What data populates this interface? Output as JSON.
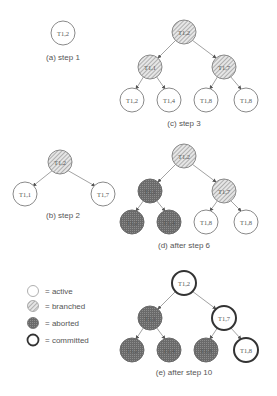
{
  "colors": {
    "stroke": "#8a8a8a",
    "text": "#555555",
    "branched_fill": "#cfcfcf",
    "aborted_fill": "#6e6e6e",
    "committed_stroke": "#333333"
  },
  "legend": {
    "items": [
      {
        "state": "active",
        "label": "= active"
      },
      {
        "state": "branched",
        "label": "= branched"
      },
      {
        "state": "aborted",
        "label": "= aborted"
      },
      {
        "state": "committed",
        "label": "= committed"
      }
    ]
  },
  "panels": {
    "a": {
      "caption": "(a) step 1",
      "nodes": [
        {
          "label": "T1,2",
          "state": "active"
        }
      ]
    },
    "b": {
      "caption": "(b) step 2",
      "nodes": [
        {
          "label": "T1,2",
          "state": "branched"
        },
        {
          "label": "T1,1",
          "state": "active"
        },
        {
          "label": "T1,7",
          "state": "active"
        }
      ]
    },
    "c": {
      "caption": "(c) step 3",
      "nodes": [
        {
          "label": "T1,2",
          "state": "branched"
        },
        {
          "label": "T1,1",
          "state": "branched"
        },
        {
          "label": "T1,7",
          "state": "branched"
        },
        {
          "label": "T1,2",
          "state": "active"
        },
        {
          "label": "T1,4",
          "state": "active"
        },
        {
          "label": "T1,8",
          "state": "active"
        },
        {
          "label": "T1,8",
          "state": "active"
        }
      ]
    },
    "d": {
      "caption": "(d) after step 6",
      "nodes": [
        {
          "label": "T1,2",
          "state": "branched"
        },
        {
          "label": "T1,1",
          "state": "aborted"
        },
        {
          "label": "T1,7",
          "state": "branched"
        },
        {
          "label": "T1,2",
          "state": "aborted"
        },
        {
          "label": "T1,4",
          "state": "aborted"
        },
        {
          "label": "T1,8",
          "state": "active"
        },
        {
          "label": "T1,8",
          "state": "active"
        }
      ]
    },
    "e": {
      "caption": "(e) after step 10",
      "nodes": [
        {
          "label": "T1,2",
          "state": "committed"
        },
        {
          "label": "T1,1",
          "state": "aborted"
        },
        {
          "label": "T1,7",
          "state": "committed"
        },
        {
          "label": "T1,2",
          "state": "aborted"
        },
        {
          "label": "T1,4",
          "state": "aborted"
        },
        {
          "label": "T1,8",
          "state": "aborted"
        },
        {
          "label": "T1,8",
          "state": "committed"
        }
      ]
    }
  }
}
